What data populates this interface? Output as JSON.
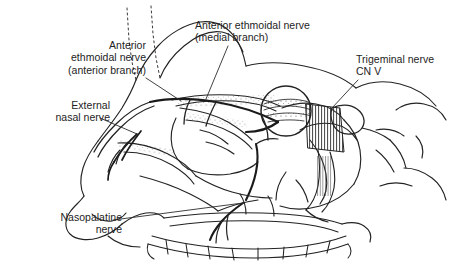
{
  "figure": {
    "type": "anatomical-line-drawing",
    "background_color": "#ffffff",
    "ink_color": "#232323",
    "width": 449,
    "height": 280
  },
  "labels": [
    {
      "id": "anterior-ethmoidal-anterior",
      "text": "Anterior\nethmoidal nerve\n(anterior branch)",
      "align": "right",
      "leader": {
        "from": [
          146,
          78
        ],
        "to": [
          181,
          101
        ]
      }
    },
    {
      "id": "anterior-ethmoidal-medial",
      "text": "Anterior ethmoidal nerve\n(medial branch)",
      "align": "left",
      "leader": {
        "from": [
          228,
          46
        ],
        "to": [
          206,
          99
        ]
      }
    },
    {
      "id": "trigeminal-nerve",
      "text": "Trigeminal nerve\nCN V",
      "align": "left",
      "leader": {
        "from": [
          358,
          80
        ],
        "to": [
          332,
          108
        ]
      }
    },
    {
      "id": "external-nasal-nerve",
      "text": "External\nnasal nerve",
      "align": "right",
      "leader": {
        "from": [
          100,
          118
        ],
        "to": [
          137,
          134
        ]
      }
    },
    {
      "id": "nasopalatine-nerve",
      "text": "Nasopalatine\nnerve",
      "align": "right",
      "leader": {
        "from": [
          113,
          220
        ],
        "to": [
          243,
          203
        ]
      }
    }
  ],
  "structures": [
    {
      "name": "frontal-bone-outline"
    },
    {
      "name": "nasal-bone"
    },
    {
      "name": "nose-profile"
    },
    {
      "name": "nasal-septum-hatching"
    },
    {
      "name": "cribriform-plate"
    },
    {
      "name": "sphenoid-sinus"
    },
    {
      "name": "pterygopalatine-region-hatching"
    },
    {
      "name": "magnifier-circle-inset"
    },
    {
      "name": "hard-palate"
    },
    {
      "name": "maxillary-teeth-row"
    },
    {
      "name": "nasopalatine-nerve-path"
    },
    {
      "name": "anterior-ethmoidal-nerve-path"
    },
    {
      "name": "external-nasal-nerve-path"
    },
    {
      "name": "trigeminal-ganglion"
    }
  ]
}
